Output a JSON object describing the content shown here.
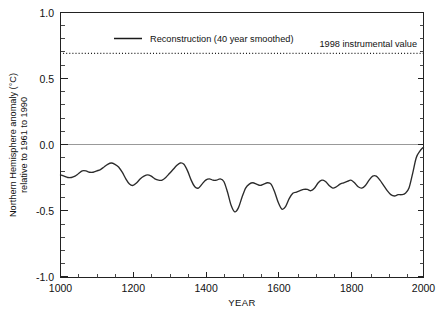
{
  "chart_data": {
    "type": "line",
    "title": "",
    "xlabel": "YEAR",
    "ylabel_line1": "Northern Hemisphere anomaly (°C)",
    "ylabel_line2": "relative to 1961 to 1990",
    "xlim": [
      1000,
      2000
    ],
    "ylim": [
      -1.0,
      1.0
    ],
    "xticks": [
      1000,
      1200,
      1400,
      1600,
      1800,
      2000
    ],
    "xtick_labels": [
      "1000",
      "1200",
      "1400",
      "1600",
      "1800",
      "2000"
    ],
    "yticks": [
      -1.0,
      -0.5,
      0.0,
      0.5,
      1.0
    ],
    "ytick_labels": [
      "-1.0",
      "-0.5",
      "0.0",
      "0.5",
      "1.0"
    ],
    "xminor_step": 50,
    "yminor_step": 0.1,
    "grid": false,
    "zero_reference": 0.0,
    "legend": {
      "position": "top-left-inside",
      "entries": [
        {
          "label": "Reconstruction (40 year smoothed)",
          "style": "solid",
          "color": "#2b2b2b"
        }
      ]
    },
    "annotations": [
      {
        "name": "instrumental-1998",
        "text": "1998 instrumental value",
        "value": 0.69,
        "style": "dotted",
        "color": "#1a1a1a"
      }
    ],
    "series": [
      {
        "name": "Reconstruction (40 year smoothed)",
        "color": "#2b2b2b",
        "x": [
          1000,
          1010,
          1020,
          1030,
          1040,
          1050,
          1060,
          1070,
          1080,
          1090,
          1100,
          1110,
          1120,
          1130,
          1140,
          1150,
          1160,
          1170,
          1180,
          1190,
          1200,
          1210,
          1220,
          1230,
          1240,
          1250,
          1260,
          1270,
          1280,
          1290,
          1300,
          1310,
          1320,
          1330,
          1340,
          1350,
          1360,
          1370,
          1380,
          1390,
          1400,
          1410,
          1420,
          1430,
          1440,
          1450,
          1460,
          1470,
          1480,
          1490,
          1500,
          1510,
          1520,
          1530,
          1540,
          1550,
          1560,
          1570,
          1580,
          1590,
          1600,
          1610,
          1620,
          1630,
          1640,
          1650,
          1660,
          1670,
          1680,
          1690,
          1700,
          1710,
          1720,
          1730,
          1740,
          1750,
          1760,
          1770,
          1780,
          1790,
          1800,
          1810,
          1820,
          1830,
          1840,
          1850,
          1860,
          1870,
          1880,
          1890,
          1900,
          1910,
          1920,
          1930,
          1940,
          1950,
          1960,
          1970,
          1980,
          1990,
          2000
        ],
        "values": [
          -0.23,
          -0.24,
          -0.25,
          -0.25,
          -0.24,
          -0.22,
          -0.2,
          -0.2,
          -0.21,
          -0.21,
          -0.2,
          -0.19,
          -0.17,
          -0.15,
          -0.14,
          -0.15,
          -0.17,
          -0.21,
          -0.26,
          -0.3,
          -0.31,
          -0.29,
          -0.26,
          -0.24,
          -0.23,
          -0.24,
          -0.26,
          -0.27,
          -0.27,
          -0.25,
          -0.22,
          -0.19,
          -0.16,
          -0.14,
          -0.15,
          -0.2,
          -0.27,
          -0.32,
          -0.33,
          -0.3,
          -0.27,
          -0.26,
          -0.27,
          -0.27,
          -0.26,
          -0.28,
          -0.36,
          -0.46,
          -0.51,
          -0.48,
          -0.4,
          -0.33,
          -0.3,
          -0.29,
          -0.3,
          -0.31,
          -0.3,
          -0.29,
          -0.3,
          -0.36,
          -0.44,
          -0.49,
          -0.47,
          -0.41,
          -0.37,
          -0.36,
          -0.35,
          -0.34,
          -0.34,
          -0.35,
          -0.33,
          -0.29,
          -0.27,
          -0.28,
          -0.31,
          -0.33,
          -0.32,
          -0.3,
          -0.29,
          -0.28,
          -0.27,
          -0.29,
          -0.32,
          -0.33,
          -0.31,
          -0.27,
          -0.24,
          -0.24,
          -0.27,
          -0.31,
          -0.35,
          -0.38,
          -0.39,
          -0.38,
          -0.38,
          -0.37,
          -0.33,
          -0.22,
          -0.1,
          -0.05,
          -0.02
        ]
      }
    ]
  }
}
